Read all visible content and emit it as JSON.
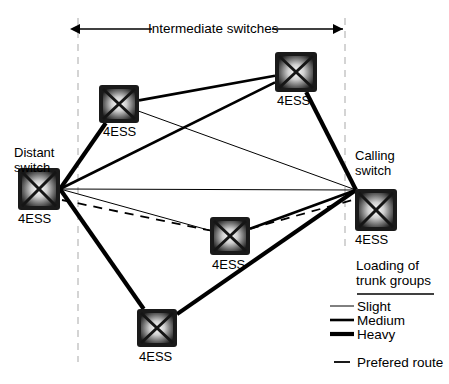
{
  "diagram": {
    "title_annotation": "Intermediate switches",
    "node_label": "4ESS",
    "nodes": [
      {
        "id": "distant",
        "name": "Distant switch",
        "title_lines": [
          "Distant",
          "switch"
        ],
        "label": "4ESS",
        "x": 18,
        "y": 168,
        "w": 42,
        "h": 42,
        "title_x": 14,
        "title_y": 146,
        "label_x": 18,
        "label_y": 212
      },
      {
        "id": "upper_left",
        "name": "intermediate upper left",
        "title_lines": [],
        "label": "4ESS",
        "x": 99,
        "y": 85,
        "w": 40,
        "h": 38,
        "label_x": 103,
        "label_y": 125
      },
      {
        "id": "top",
        "name": "intermediate top",
        "title_lines": [],
        "label": "4ESS",
        "x": 275,
        "y": 52,
        "w": 42,
        "h": 40,
        "label_x": 277,
        "label_y": 94
      },
      {
        "id": "center",
        "name": "intermediate center",
        "title_lines": [],
        "label": "4ESS",
        "x": 210,
        "y": 217,
        "w": 40,
        "h": 38,
        "label_x": 212,
        "label_y": 258
      },
      {
        "id": "bottom",
        "name": "intermediate bottom",
        "title_lines": [],
        "label": "4ESS",
        "x": 137,
        "y": 309,
        "w": 40,
        "h": 38,
        "label_x": 139,
        "label_y": 350
      },
      {
        "id": "calling",
        "name": "Calling switch",
        "title_lines": [
          "Calling",
          "switch"
        ],
        "label": "4ESS",
        "x": 355,
        "y": 189,
        "w": 42,
        "h": 42,
        "title_x": 355,
        "title_y": 149,
        "label_x": 355,
        "label_y": 233
      }
    ],
    "edges": [
      {
        "from": "distant",
        "to": "upper_left",
        "loading": "heavy"
      },
      {
        "from": "distant",
        "to": "top",
        "loading": "medium"
      },
      {
        "from": "distant",
        "to": "calling",
        "loading": "slight"
      },
      {
        "from": "distant",
        "to": "center",
        "loading": "slight"
      },
      {
        "from": "distant",
        "to": "bottom",
        "loading": "heavy"
      },
      {
        "from": "upper_left",
        "to": "calling",
        "loading": "slight"
      },
      {
        "from": "upper_left",
        "to": "top",
        "loading": "medium"
      },
      {
        "from": "top",
        "to": "calling",
        "loading": "heavy"
      },
      {
        "from": "center",
        "to": "calling",
        "loading": "medium"
      },
      {
        "from": "bottom",
        "to": "calling",
        "loading": "heavy"
      }
    ],
    "preferred_route": [
      "distant",
      "center",
      "calling"
    ],
    "boundaries": [
      {
        "id": "left-boundary",
        "x": 78
      },
      {
        "id": "right-boundary",
        "x": 345
      }
    ]
  },
  "legend": {
    "title_line1": "Loading of",
    "title_line2": "trunk groups",
    "items": [
      {
        "key": "slight",
        "label": "Slight",
        "style": "solid",
        "width": 1
      },
      {
        "key": "medium",
        "label": "Medium",
        "style": "solid",
        "width": 2.6
      },
      {
        "key": "heavy",
        "label": "Heavy",
        "style": "solid",
        "width": 4.2
      }
    ],
    "preferred": {
      "key": "preferred",
      "label": "Prefered route",
      "style": "dashed",
      "width": 1.6
    }
  },
  "colors": {
    "line": "#000000",
    "boundary": "#b8b8b8",
    "background": "#ffffff",
    "node_dark": "#1a1a1a",
    "node_light": "#f2f2f2"
  }
}
